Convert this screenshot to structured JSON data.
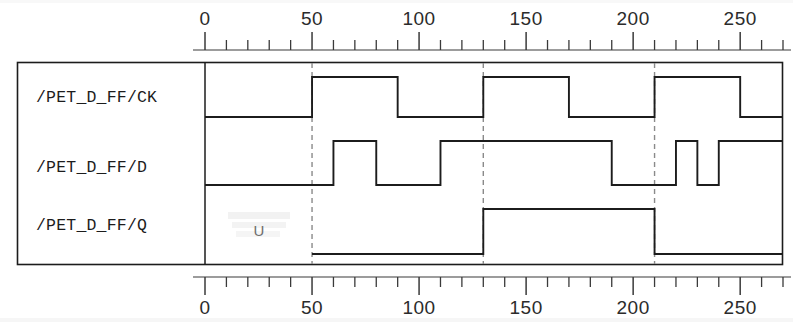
{
  "diagram": {
    "type": "timing-diagram",
    "background_color": "#ffffff",
    "line_color": "#1c1c1c",
    "marker_color": "#8a8a8a",
    "undefined_marker": "U"
  },
  "axis": {
    "orientation": "horizontal",
    "min": 0,
    "max": 270,
    "major_step": 50,
    "minor_step": 10,
    "top_ticks": [
      0,
      10,
      20,
      30,
      40,
      50,
      60,
      70,
      80,
      90,
      100,
      110,
      120,
      130,
      140,
      150,
      160,
      170,
      180,
      190,
      200,
      210,
      220,
      230,
      240,
      250,
      260,
      270
    ],
    "bottom_ticks": [
      0,
      10,
      20,
      30,
      40,
      50,
      60,
      70,
      80,
      90,
      100,
      110,
      120,
      130,
      140,
      150,
      160,
      170,
      180,
      190,
      200,
      210,
      220,
      230,
      240,
      250,
      260,
      270
    ],
    "top_labels": [
      "0",
      "50",
      "100",
      "150",
      "200",
      "250"
    ],
    "bottom_labels": [
      "0",
      "50",
      "100",
      "150",
      "200",
      "250"
    ],
    "label_values": [
      0,
      50,
      100,
      150,
      200,
      250
    ]
  },
  "markers": {
    "description": "dashed vertical cursors at clock rising edges",
    "times": [
      50,
      130,
      210
    ]
  },
  "signals": [
    {
      "name": "/PET_D_FF/CK",
      "label": "/PET_D_FF/CK",
      "initial_state": "0",
      "transitions": [
        {
          "time": 0,
          "value": 0
        },
        {
          "time": 50,
          "value": 1
        },
        {
          "time": 90,
          "value": 0
        },
        {
          "time": 130,
          "value": 1
        },
        {
          "time": 170,
          "value": 0
        },
        {
          "time": 210,
          "value": 1
        },
        {
          "time": 250,
          "value": 0
        },
        {
          "time": 270,
          "value": 0
        }
      ]
    },
    {
      "name": "/PET_D_FF/D",
      "label": "/PET_D_FF/D",
      "initial_state": "0",
      "transitions": [
        {
          "time": 0,
          "value": 0
        },
        {
          "time": 60,
          "value": 1
        },
        {
          "time": 80,
          "value": 0
        },
        {
          "time": 110,
          "value": 1
        },
        {
          "time": 190,
          "value": 0
        },
        {
          "time": 220,
          "value": 1
        },
        {
          "time": 230,
          "value": 0
        },
        {
          "time": 240,
          "value": 1
        },
        {
          "time": 270,
          "value": 1
        }
      ]
    },
    {
      "name": "/PET_D_FF/Q",
      "label": "/PET_D_FF/Q",
      "initial_state": "U",
      "undefined_until": 50,
      "transitions": [
        {
          "time": 50,
          "value": 0
        },
        {
          "time": 130,
          "value": 1
        },
        {
          "time": 210,
          "value": 0
        },
        {
          "time": 270,
          "value": 0
        }
      ]
    }
  ]
}
